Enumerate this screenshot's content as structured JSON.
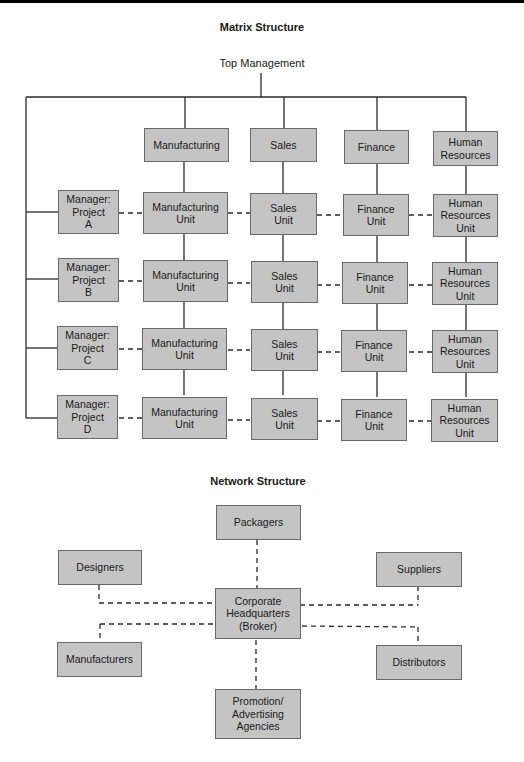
{
  "matrix": {
    "title": "Matrix Structure",
    "top": "Top Management",
    "functions": [
      "Manufacturing",
      "Sales",
      "Finance",
      "Human\nResources"
    ],
    "rows": [
      {
        "manager": "Manager:\nProject\nA",
        "units": [
          "Manufacturing\nUnit",
          "Sales\nUnit",
          "Finance\nUnit",
          "Human\nResources\nUnit"
        ]
      },
      {
        "manager": "Manager:\nProject\nB",
        "units": [
          "Manufacturing\nUnit",
          "Sales\nUnit",
          "Finance\nUnit",
          "Human\nResources\nUnit"
        ]
      },
      {
        "manager": "Manager:\nProject\nC",
        "units": [
          "Manufacturing\nUnit",
          "Sales\nUnit",
          "Finance\nUnit",
          "Human\nResources\nUnit"
        ]
      },
      {
        "manager": "Manager:\nProject\nD",
        "units": [
          "Manufacturing\nUnit",
          "Sales\nUnit",
          "Finance\nUnit",
          "Human\nResources\nUnit"
        ]
      }
    ]
  },
  "network": {
    "title": "Network Structure",
    "center": "Corporate\nHeadquarters\n(Broker)",
    "nodes": {
      "packagers": "Packagers",
      "designers": "Designers",
      "suppliers": "Suppliers",
      "manufacturers": "Manufacturers",
      "distributors": "Distributors",
      "promotion": "Promotion/\nAdvertising\nAgencies"
    }
  },
  "colors": {
    "box_fill": "#c4c4c4",
    "box_border": "#6a6a6a",
    "line": "#2a2a2a"
  }
}
